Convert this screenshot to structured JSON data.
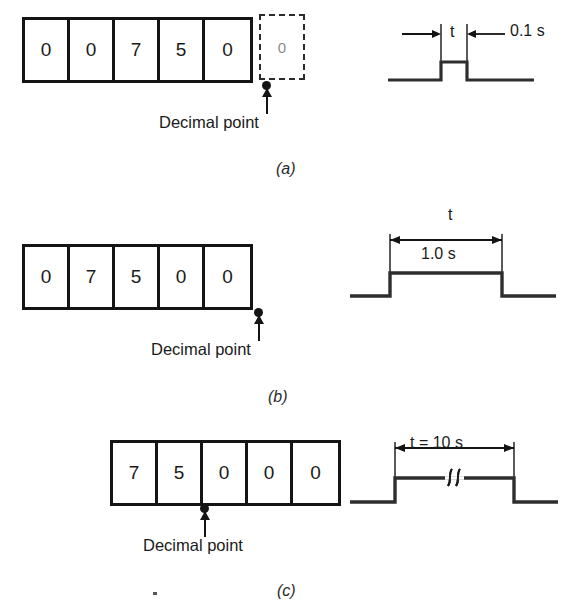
{
  "figure": {
    "panels": [
      {
        "letter": "(a)",
        "display": {
          "digits": [
            "0",
            "0",
            "7",
            "5",
            "0"
          ],
          "ghost_digit": "0",
          "ghost_cell_dashed": true,
          "decimal_point_label": "Decimal point",
          "decimal_point_position": "right-of-last-solid-digit"
        },
        "waveform": {
          "dimension_symbol": "t",
          "duration_label": "0.1 s",
          "pulse_width_px": 26,
          "break_symbol": "",
          "arrows": "inward"
        }
      },
      {
        "letter": "(b)",
        "display": {
          "digits": [
            "0",
            "7",
            "5",
            "0",
            "0"
          ],
          "ghost_digit": "",
          "ghost_cell_dashed": false,
          "decimal_point_label": "Decimal point",
          "decimal_point_position": "right-edge"
        },
        "waveform": {
          "dimension_symbol": "t",
          "duration_label": "1.0 s",
          "pulse_width_px": 112,
          "break_symbol": "",
          "arrows": "outward"
        }
      },
      {
        "letter": "(c)",
        "display": {
          "digits": [
            "7",
            "5",
            "0",
            "0",
            "0"
          ],
          "ghost_digit": "",
          "ghost_cell_dashed": false,
          "decimal_point_label": "Decimal point",
          "decimal_point_position": "between-digit-2-and-3"
        },
        "waveform": {
          "dimension_symbol": "t",
          "duration_label": "t = 10 s",
          "pulse_width_px": 120,
          "break_symbol": "∫∫",
          "arrows": "outward"
        }
      }
    ],
    "ink_color": "#141414",
    "background_color": "#ffffff"
  }
}
